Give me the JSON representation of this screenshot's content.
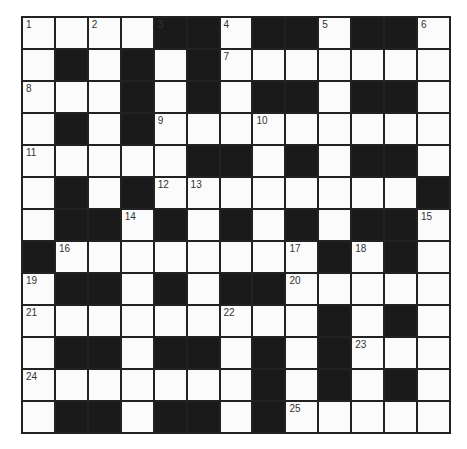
{
  "puzzle": {
    "rows": 13,
    "cols": 13,
    "colors": {
      "block": "#1a1a1a",
      "cell": "#fbfbfb",
      "border": "#222222",
      "number": "#333333"
    },
    "grid": [
      "....#.##.##.",
      ".#.#.#.......",
      "...#.#.##.##.",
      ".#.#.........",
      ".....##.#.##.",
      ".#.#........#",
      ".##.#.#.#.##.",
      "#........#.#.",
      ".##.#.##.....",
      ".........#.#.",
      ".##.##.#.#...",
      ".......#.#.#.",
      ".##.##.#....."
    ],
    "numbers": [
      {
        "r": 0,
        "c": 0,
        "n": "1"
      },
      {
        "r": 0,
        "c": 2,
        "n": "2"
      },
      {
        "r": 0,
        "c": 4,
        "n": "3"
      },
      {
        "r": 0,
        "c": 6,
        "n": "4"
      },
      {
        "r": 0,
        "c": 9,
        "n": "5"
      },
      {
        "r": 0,
        "c": 12,
        "n": "6"
      },
      {
        "r": 1,
        "c": 6,
        "n": "7"
      },
      {
        "r": 2,
        "c": 0,
        "n": "8"
      },
      {
        "r": 3,
        "c": 4,
        "n": "9"
      },
      {
        "r": 3,
        "c": 7,
        "n": "10"
      },
      {
        "r": 4,
        "c": 0,
        "n": "11"
      },
      {
        "r": 5,
        "c": 4,
        "n": "12"
      },
      {
        "r": 5,
        "c": 5,
        "n": "13"
      },
      {
        "r": 6,
        "c": 3,
        "n": "14"
      },
      {
        "r": 6,
        "c": 12,
        "n": "15"
      },
      {
        "r": 7,
        "c": 1,
        "n": "16"
      },
      {
        "r": 7,
        "c": 8,
        "n": "17"
      },
      {
        "r": 7,
        "c": 10,
        "n": "18"
      },
      {
        "r": 8,
        "c": 0,
        "n": "19"
      },
      {
        "r": 8,
        "c": 8,
        "n": "20"
      },
      {
        "r": 9,
        "c": 0,
        "n": "21"
      },
      {
        "r": 9,
        "c": 6,
        "n": "22"
      },
      {
        "r": 10,
        "c": 10,
        "n": "23"
      },
      {
        "r": 11,
        "c": 0,
        "n": "24"
      },
      {
        "r": 12,
        "c": 8,
        "n": "25"
      }
    ]
  }
}
